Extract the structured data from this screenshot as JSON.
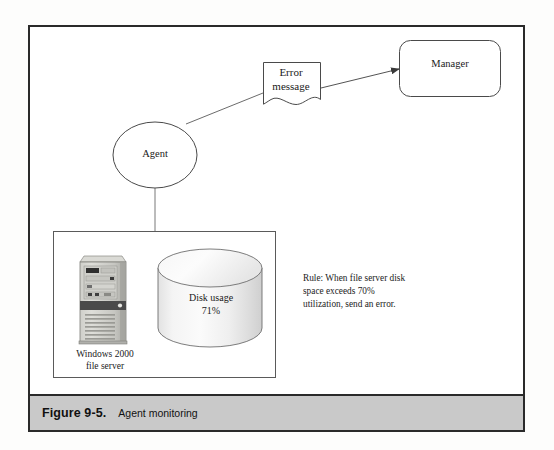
{
  "figure": {
    "caption_number": "Figure 9-5.",
    "caption_title": "Agent monitoring"
  },
  "nodes": {
    "manager": {
      "label": "Manager",
      "shape": "rounded-rectangle"
    },
    "error_message": {
      "label": "Error\nmessage",
      "shape": "document"
    },
    "agent": {
      "label": "Agent",
      "shape": "ellipse"
    },
    "disk": {
      "label": "Disk usage\n71%",
      "shape": "cylinder",
      "usage_percent": "71%"
    },
    "file_server": {
      "label": "Windows 2000\nfile server",
      "shape": "tower-computer"
    }
  },
  "annotation": {
    "rule_text": "Rule: When file server disk\nspace exceeds 70%\nutilization, send an error."
  },
  "colors": {
    "frame": "#2a2a2a",
    "caption_band": "#c9c9c9",
    "stroke": "#555555",
    "cylinder_light": "#fbfbfb",
    "cylinder_shade": "#d2d2d2",
    "tower_body": "#b9b9b4",
    "text": "#1a1a1a"
  }
}
